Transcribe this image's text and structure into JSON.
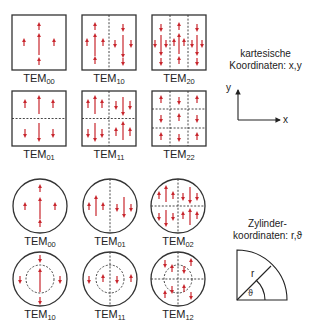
{
  "colors": {
    "field_arrow": "#c8262d",
    "outline": "#333333",
    "background": "#ffffff"
  },
  "cartesian": {
    "caption_line1": "kartesische",
    "caption_line2": "Koordinaten: x,y",
    "axis_x": "x",
    "axis_y": "y",
    "modes": [
      {
        "base": "TEM",
        "sub": "00"
      },
      {
        "base": "TEM",
        "sub": "10"
      },
      {
        "base": "TEM",
        "sub": "20"
      },
      {
        "base": "TEM",
        "sub": "01"
      },
      {
        "base": "TEM",
        "sub": "11"
      },
      {
        "base": "TEM",
        "sub": "22"
      }
    ]
  },
  "cylindrical": {
    "caption_line1": "Zylinder-",
    "caption_line2": "koordinaten: r,ϑ",
    "radius_label": "r",
    "angle_label": "ϑ",
    "modes": [
      {
        "base": "TEM",
        "sub": "00"
      },
      {
        "base": "TEM",
        "sub": "01"
      },
      {
        "base": "TEM",
        "sub": "02"
      },
      {
        "base": "TEM",
        "sub": "10"
      },
      {
        "base": "TEM",
        "sub": "11"
      },
      {
        "base": "TEM",
        "sub": "12"
      }
    ]
  }
}
